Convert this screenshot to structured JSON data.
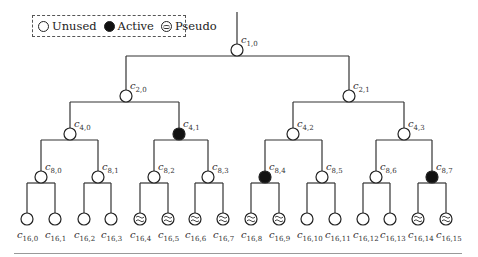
{
  "legend": {
    "items": [
      {
        "label": "Unused",
        "state": "unused"
      },
      {
        "label": "Active",
        "state": "active"
      },
      {
        "label": "Pseudo",
        "state": "pseudo"
      }
    ]
  },
  "tree": {
    "nodes": [
      {
        "id": "c1,0",
        "sf": "1",
        "idx": "0",
        "x": 237,
        "y": 50,
        "state": "unused"
      },
      {
        "id": "c2,0",
        "sf": "2",
        "idx": "0",
        "x": 126,
        "y": 96,
        "state": "unused"
      },
      {
        "id": "c2,1",
        "sf": "2",
        "idx": "1",
        "x": 349,
        "y": 96,
        "state": "unused"
      },
      {
        "id": "c4,0",
        "sf": "4",
        "idx": "0",
        "x": 70,
        "y": 134,
        "state": "unused"
      },
      {
        "id": "c4,1",
        "sf": "4",
        "idx": "1",
        "x": 179,
        "y": 134,
        "state": "active"
      },
      {
        "id": "c4,2",
        "sf": "4",
        "idx": "2",
        "x": 293,
        "y": 134,
        "state": "unused"
      },
      {
        "id": "c4,3",
        "sf": "4",
        "idx": "3",
        "x": 404,
        "y": 134,
        "state": "unused"
      },
      {
        "id": "c8,0",
        "sf": "8",
        "idx": "0",
        "x": 41,
        "y": 177,
        "state": "unused"
      },
      {
        "id": "c8,1",
        "sf": "8",
        "idx": "1",
        "x": 98,
        "y": 177,
        "state": "unused"
      },
      {
        "id": "c8,2",
        "sf": "8",
        "idx": "2",
        "x": 154,
        "y": 177,
        "state": "unused"
      },
      {
        "id": "c8,3",
        "sf": "8",
        "idx": "3",
        "x": 208,
        "y": 177,
        "state": "unused"
      },
      {
        "id": "c8,4",
        "sf": "8",
        "idx": "4",
        "x": 265,
        "y": 177,
        "state": "active"
      },
      {
        "id": "c8,5",
        "sf": "8",
        "idx": "5",
        "x": 322,
        "y": 177,
        "state": "unused"
      },
      {
        "id": "c8,6",
        "sf": "8",
        "idx": "6",
        "x": 376,
        "y": 177,
        "state": "unused"
      },
      {
        "id": "c8,7",
        "sf": "8",
        "idx": "7",
        "x": 432,
        "y": 177,
        "state": "active"
      },
      {
        "id": "c16,0",
        "sf": "16",
        "idx": "0",
        "x": 27,
        "y": 219,
        "state": "unused"
      },
      {
        "id": "c16,1",
        "sf": "16",
        "idx": "1",
        "x": 55,
        "y": 219,
        "state": "unused"
      },
      {
        "id": "c16,2",
        "sf": "16",
        "idx": "2",
        "x": 84,
        "y": 219,
        "state": "unused"
      },
      {
        "id": "c16,3",
        "sf": "16",
        "idx": "3",
        "x": 111,
        "y": 219,
        "state": "unused"
      },
      {
        "id": "c16,4",
        "sf": "16",
        "idx": "4",
        "x": 140,
        "y": 219,
        "state": "pseudo"
      },
      {
        "id": "c16,5",
        "sf": "16",
        "idx": "5",
        "x": 168,
        "y": 219,
        "state": "pseudo"
      },
      {
        "id": "c16,6",
        "sf": "16",
        "idx": "6",
        "x": 195,
        "y": 219,
        "state": "pseudo"
      },
      {
        "id": "c16,7",
        "sf": "16",
        "idx": "7",
        "x": 223,
        "y": 219,
        "state": "pseudo"
      },
      {
        "id": "c16,8",
        "sf": "16",
        "idx": "8",
        "x": 251,
        "y": 219,
        "state": "pseudo"
      },
      {
        "id": "c16,9",
        "sf": "16",
        "idx": "9",
        "x": 279,
        "y": 219,
        "state": "pseudo"
      },
      {
        "id": "c16,10",
        "sf": "16",
        "idx": "10",
        "x": 307,
        "y": 219,
        "state": "unused"
      },
      {
        "id": "c16,11",
        "sf": "16",
        "idx": "11",
        "x": 335,
        "y": 219,
        "state": "unused"
      },
      {
        "id": "c16,12",
        "sf": "16",
        "idx": "12",
        "x": 363,
        "y": 219,
        "state": "unused"
      },
      {
        "id": "c16,13",
        "sf": "16",
        "idx": "13",
        "x": 390,
        "y": 219,
        "state": "unused"
      },
      {
        "id": "c16,14",
        "sf": "16",
        "idx": "14",
        "x": 418,
        "y": 219,
        "state": "pseudo"
      },
      {
        "id": "c16,15",
        "sf": "16",
        "idx": "15",
        "x": 446,
        "y": 219,
        "state": "pseudo"
      }
    ]
  }
}
